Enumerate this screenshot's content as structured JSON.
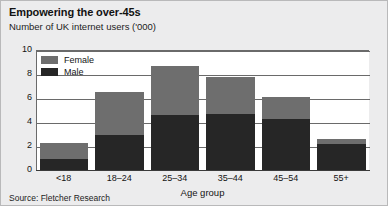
{
  "chart_data": {
    "type": "bar",
    "subtype": "stacked-vertical",
    "title": "Empowering the over-45s",
    "subtitle": "Number of UK internet users ('000)",
    "xlabel": "Age group",
    "ylabel": "",
    "source": "Source: Fletcher Research",
    "categories": [
      "<18",
      "18–24",
      "25–34",
      "35–44",
      "45–54",
      "55+"
    ],
    "series": [
      {
        "name": "Male",
        "color": "#262626",
        "values": [
          0.9,
          2.9,
          4.6,
          4.7,
          4.25,
          2.2
        ]
      },
      {
        "name": "Female",
        "color": "#6e6e6e",
        "values": [
          1.35,
          3.6,
          4.1,
          3.05,
          1.85,
          0.4
        ]
      }
    ],
    "totals": [
      2.25,
      6.5,
      8.7,
      7.75,
      6.1,
      2.6
    ],
    "ylim": [
      0,
      10
    ],
    "yticks": [
      "0",
      "2",
      "4",
      "6",
      "8",
      "10"
    ],
    "ytick_values": [
      0,
      2,
      4,
      6,
      8,
      10
    ],
    "grid": true,
    "grid_axis": "y",
    "legend_position": "top-left-inside",
    "legend": [
      {
        "label": "Female",
        "color": "#6e6e6e"
      },
      {
        "label": "Male",
        "color": "#262626"
      }
    ]
  },
  "colors": {
    "female": "#6e6e6e",
    "male": "#262626",
    "frame": "#ececed",
    "plot_background": "#ffffff",
    "axis": "#6a6a6a"
  }
}
